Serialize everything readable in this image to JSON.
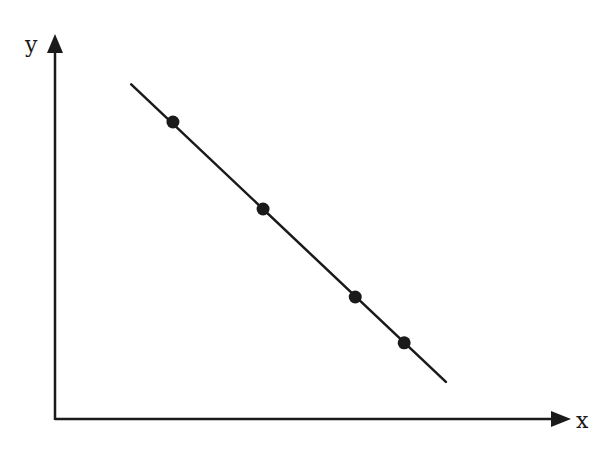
{
  "chart_data": {
    "type": "scatter",
    "title": "",
    "xlabel": "x",
    "ylabel": "y",
    "xlim": [
      0,
      10
    ],
    "ylim": [
      0,
      7.5
    ],
    "grid": false,
    "legend": null,
    "ticks": false,
    "points": [
      {
        "x": 2.29,
        "y": 5.79
      },
      {
        "x": 4.04,
        "y": 4.1
      },
      {
        "x": 5.83,
        "y": 2.39
      },
      {
        "x": 6.78,
        "y": 1.5
      }
    ],
    "fit_line": {
      "x1": 1.48,
      "y1": 6.52,
      "x2": 7.59,
      "y2": 0.74
    },
    "colors": {
      "ink": "#1a1a1a"
    }
  }
}
